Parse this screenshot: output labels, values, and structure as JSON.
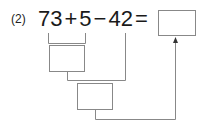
{
  "problem": {
    "label": "(2)",
    "terms": [
      "73",
      "+",
      "5",
      "−",
      "42",
      "="
    ],
    "answer_box_value": "",
    "intermediate_box_1_value": "",
    "intermediate_box_2_value": ""
  }
}
